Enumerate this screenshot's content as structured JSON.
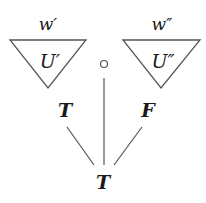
{
  "diagram": {
    "left_subtree": {
      "world_label": "w′",
      "tree_label": "U′"
    },
    "right_subtree": {
      "world_label": "w″",
      "tree_label": "U″"
    },
    "middle_node": {
      "symbol": "circle"
    },
    "children": [
      {
        "label": "T"
      },
      {
        "label": "F"
      }
    ],
    "root": {
      "label": "T"
    },
    "colors": {
      "stroke": "#555555",
      "text": "#1a1a1a",
      "background": "#ffffff"
    }
  }
}
